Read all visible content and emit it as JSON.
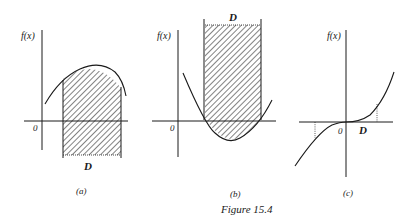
{
  "figure": {
    "caption": "Figure 15.4",
    "panels": [
      {
        "id": "a",
        "label": "(a)",
        "y_axis_label": "f(x)",
        "origin_label": "0",
        "region_label": "D",
        "description": "concave curve above x-axis; hatched vertical strip over domain D extending below axis"
      },
      {
        "id": "b",
        "label": "(b)",
        "y_axis_label": "f(x)",
        "origin_label": "0",
        "region_label": "D",
        "description": "convex parabola dipping below x-axis; hatched strip over D extending upward"
      },
      {
        "id": "c",
        "label": "(c)",
        "y_axis_label": "f(x)",
        "origin_label": "0",
        "region_label": "D",
        "description": "cubic-like curve through origin with dotted vertical markers"
      }
    ]
  },
  "colors": {
    "ink": "#1a1a1a",
    "background": "#ffffff"
  }
}
